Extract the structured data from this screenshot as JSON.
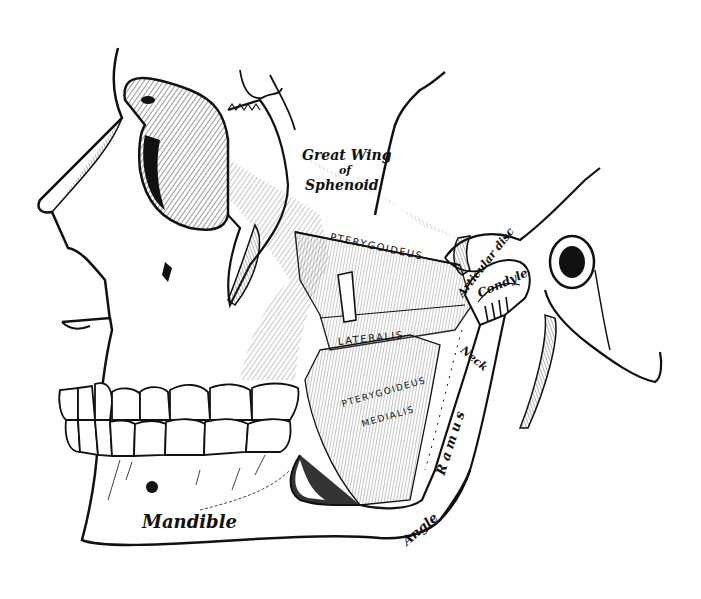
{
  "figure": {
    "colors": {
      "ink": "#111111",
      "paper": "#ffffff",
      "hatch": "#333333"
    },
    "labels": {
      "great_wing_line1": "Great Wing",
      "great_wing_line2": "of",
      "great_wing_line3": "Sphenoid",
      "pterygoideus_lateralis_1": "PTERYGOIDEUS",
      "pterygoideus_lateralis_2": "LATERALIS",
      "pterygoideus_medialis_1": "PTERYGOIDEUS",
      "pterygoideus_medialis_2": "MEDIALIS",
      "articular_disc": "Articular disc",
      "condyle": "Condyle",
      "neck": "Neck",
      "ramus": "Ramus",
      "angle": "Angle",
      "mandible": "Mandible"
    }
  }
}
